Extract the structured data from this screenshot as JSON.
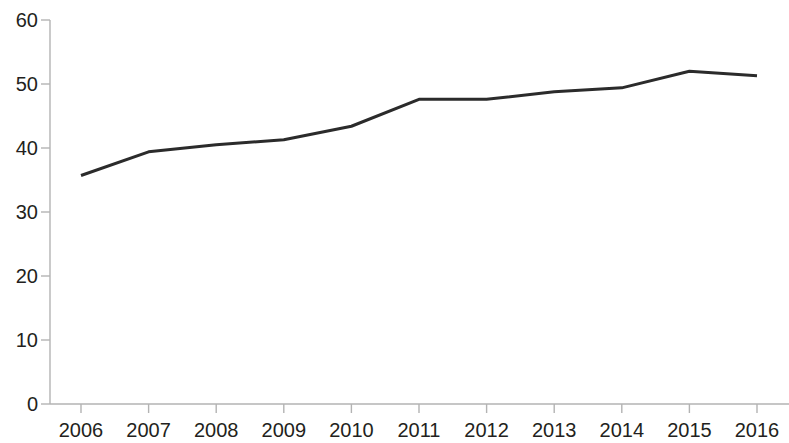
{
  "chart_data": {
    "type": "line",
    "title": "",
    "subtitle": "",
    "xlabel": "",
    "ylabel": "",
    "categories": [
      "2006",
      "2007",
      "2008",
      "2009",
      "2010",
      "2011",
      "2012",
      "2013",
      "2014",
      "2015",
      "2016"
    ],
    "series": [
      {
        "name": "series-1",
        "values": [
          35.7,
          39.4,
          40.5,
          41.3,
          43.4,
          47.6,
          47.6,
          48.8,
          49.4,
          52.0,
          51.3
        ],
        "color": "#2b2b2b",
        "line_width": 3
      }
    ],
    "x_ticks": [
      "2006",
      "2007",
      "2008",
      "2009",
      "2010",
      "2011",
      "2012",
      "2013",
      "2014",
      "2015",
      "2016"
    ],
    "y_ticks": [
      0,
      10,
      20,
      30,
      40,
      50,
      60
    ],
    "y_tick_labels": [
      "0",
      "10",
      "20",
      "30",
      "40",
      "50",
      "60"
    ],
    "ylim": [
      0,
      60
    ],
    "xlim": [
      "2006",
      "2016"
    ],
    "grid": false,
    "legend": null,
    "legend_position": "none",
    "axis_color": "#b3b3b3",
    "text_color": "#231f20",
    "background": "#ffffff",
    "annotations": []
  },
  "geometry": {
    "plot_left": 50,
    "plot_right": 757,
    "plot_top": 20,
    "plot_bottom": 404,
    "first_point_x": 81,
    "last_point_x": 757,
    "tick_length": 9,
    "x_label_y": 420,
    "y_label_right": 38
  }
}
